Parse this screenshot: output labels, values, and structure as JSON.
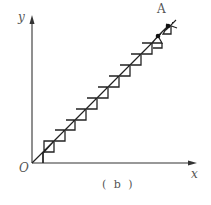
{
  "figure": {
    "caption": "( b )",
    "axis_labels": {
      "x": "x",
      "y": "y",
      "origin": "O"
    },
    "point_labels": {
      "end": "A"
    },
    "colors": {
      "stroke": "#222222",
      "label": "#555555"
    }
  }
}
